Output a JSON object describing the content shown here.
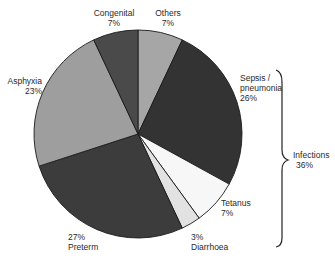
{
  "chart_data": {
    "type": "pie",
    "title": "",
    "start_angle_deg": 0,
    "direction": "clockwise",
    "slices": [
      {
        "label": "Others",
        "value": 7,
        "display": "7%",
        "color": "#a6a6a6"
      },
      {
        "label": "Sepsis / pneumonia",
        "value": 26,
        "display": "26%",
        "color": "#333333"
      },
      {
        "label": "Tetanus",
        "value": 7,
        "display": "7%",
        "color": "#f7f7f7"
      },
      {
        "label": "Diarrhoea",
        "value": 3,
        "display": "3%",
        "color": "#e2e2e2"
      },
      {
        "label": "Preterm",
        "value": 27,
        "display": "27%",
        "color": "#3c3c3c"
      },
      {
        "label": "Asphyxia",
        "value": 23,
        "display": "23%",
        "color": "#9e9e9e"
      },
      {
        "label": "Congenital",
        "value": 7,
        "display": "7%",
        "color": "#4a4a4a"
      }
    ],
    "annotations": [
      {
        "type": "bracket",
        "groups": [
          "Sepsis / pneumonia",
          "Tetanus",
          "Diarrhoea"
        ],
        "label": "Infections",
        "value": 36,
        "display": "36%"
      }
    ]
  },
  "labels": {
    "congenital_name": "Congenital",
    "congenital_pct": "7%",
    "others_name": "Others",
    "others_pct": "7%",
    "asphyxia_name": "Asphyxia",
    "asphyxia_pct": "23%",
    "sepsis_name_1": "Sepsis /",
    "sepsis_name_2": "pneumonia",
    "sepsis_pct": "26%",
    "tetanus_name": "Tetanus",
    "tetanus_pct": "7%",
    "diarrhoea_pct": "3%",
    "diarrhoea_name": "Diarrhoea",
    "preterm_pct": "27%",
    "preterm_name": "Preterm",
    "infections_name": "Infections",
    "infections_pct": "36%"
  }
}
